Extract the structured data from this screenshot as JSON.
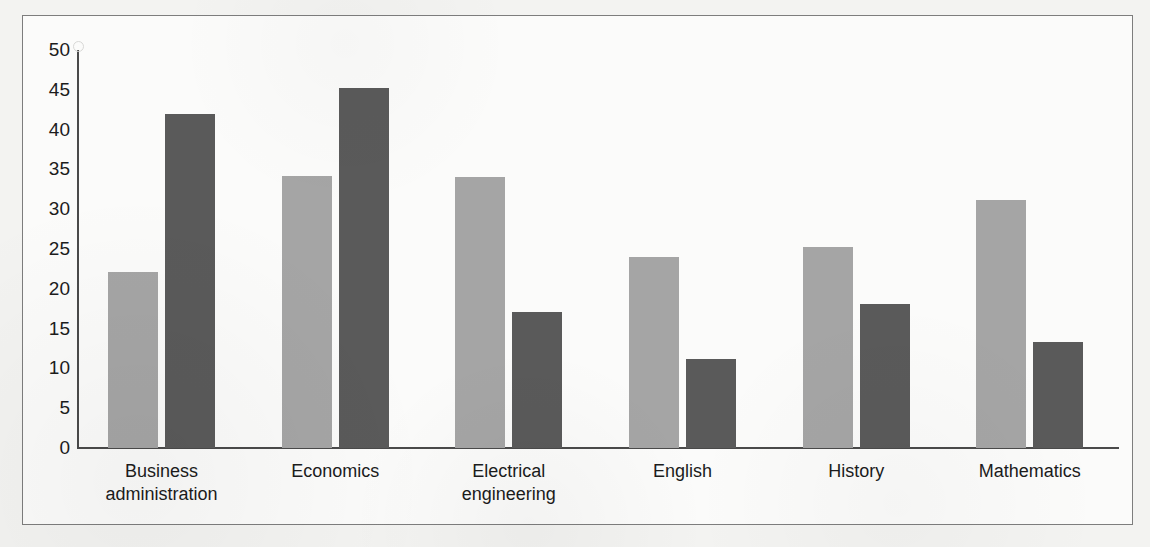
{
  "chart_data": {
    "type": "bar",
    "title": "",
    "subtitle": "",
    "xlabel": "",
    "ylabel": "",
    "ylim": [
      0,
      50
    ],
    "yticks": [
      0,
      5,
      10,
      15,
      20,
      25,
      30,
      35,
      40,
      45,
      50
    ],
    "ytick_labels": [
      "0",
      "5",
      "10",
      "15",
      "20",
      "25",
      "30",
      "35",
      "40",
      "45",
      "50"
    ],
    "grid": false,
    "legend": false,
    "legend_position": "none",
    "categories": [
      "Business administration",
      "Economics",
      "Electrical engineering",
      "English",
      "History",
      "Mathematics"
    ],
    "category_lines": [
      [
        "Business",
        "administration"
      ],
      [
        "Economics"
      ],
      [
        "Electrical",
        "engineering"
      ],
      [
        "English"
      ],
      [
        "History"
      ],
      [
        "Mathematics"
      ]
    ],
    "series": [
      {
        "name": "series-1",
        "color": "#a5a5a5",
        "values": [
          22.1,
          34.2,
          34.0,
          24.0,
          25.3,
          31.1
        ]
      },
      {
        "name": "series-2",
        "color": "#5a5a5a",
        "values": [
          42.0,
          45.2,
          17.1,
          11.2,
          18.1,
          13.3
        ]
      }
    ]
  },
  "colors": {
    "series_light": "#a5a5a5",
    "series_dark": "#5a5a5a",
    "axis": "#4a4a4a",
    "text": "#1c1c1c",
    "frame": "#7d7d7d",
    "plot_background": "#fbfbfa",
    "page_background": "#f3f3f1"
  }
}
